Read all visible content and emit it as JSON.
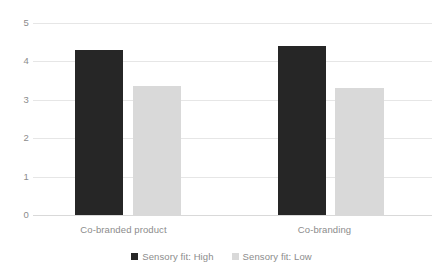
{
  "chart_data": {
    "type": "bar",
    "title": "",
    "subtitle": "",
    "xlabel": "",
    "ylabel": "",
    "categories": [
      "Co-branded product",
      "Co-branding"
    ],
    "series": [
      {
        "name": "Sensory fit: High",
        "color": "#262626",
        "values": [
          4.3,
          4.4
        ]
      },
      {
        "name": "Sensory fit: Low",
        "color": "#d9d9d9",
        "values": [
          3.35,
          3.3
        ]
      }
    ],
    "ylim": [
      0,
      5
    ],
    "yticks": [
      0,
      1,
      2,
      3,
      4,
      5
    ],
    "ytick_labels": [
      "0",
      "1",
      "2",
      "3",
      "4",
      "5"
    ],
    "grid": "horizontal",
    "legend_position": "bottom",
    "background": "#ffffff",
    "gridline_color": "#e6e6e6",
    "text_color": "#8c8c8c"
  },
  "axis": {
    "y": {
      "t5": "5",
      "t4": "4",
      "t3": "3",
      "t2": "2",
      "t1": "1",
      "t0": "0"
    },
    "x": {
      "cat0": "Co-branded product",
      "cat1": "Co-branding"
    }
  },
  "legend": {
    "items": [
      {
        "label": "Sensory fit: High"
      },
      {
        "label": "Sensory fit: Low"
      }
    ]
  }
}
